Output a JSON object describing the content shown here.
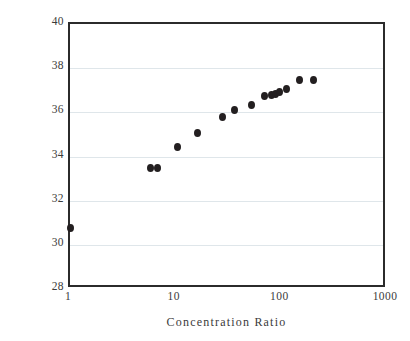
{
  "chart_data": {
    "type": "scatter",
    "title": "",
    "xlabel": "Concentration Ratio",
    "ylabel": "Coneversion Efficiency (%)",
    "xscale": "log",
    "yscale": "linear",
    "xlim": [
      1,
      1000
    ],
    "ylim": [
      28,
      40
    ],
    "xticks": [
      1,
      10,
      100,
      1000
    ],
    "xtick_labels": [
      "1",
      "10",
      "100",
      "1000"
    ],
    "yticks": [
      28,
      30,
      32,
      34,
      36,
      38,
      40
    ],
    "ytick_labels": [
      "28",
      "30",
      "32",
      "34",
      "36",
      "38",
      "40"
    ],
    "grid": "horizontal",
    "legend": "none",
    "marker_color": "#231f20",
    "marker_shape": "circle",
    "series": [
      {
        "name": "Conversion efficiency vs concentration ratio",
        "points": [
          {
            "x": 1.0,
            "y": 30.75
          },
          {
            "x": 5.8,
            "y": 33.5
          },
          {
            "x": 6.7,
            "y": 33.5
          },
          {
            "x": 10.3,
            "y": 34.45
          },
          {
            "x": 16.0,
            "y": 35.05
          },
          {
            "x": 28.0,
            "y": 35.8
          },
          {
            "x": 36.0,
            "y": 36.1
          },
          {
            "x": 52.0,
            "y": 36.35
          },
          {
            "x": 70.0,
            "y": 36.75
          },
          {
            "x": 80.0,
            "y": 36.8
          },
          {
            "x": 88.0,
            "y": 36.85
          },
          {
            "x": 97.0,
            "y": 36.9
          },
          {
            "x": 112.0,
            "y": 37.05
          },
          {
            "x": 150.0,
            "y": 37.45
          },
          {
            "x": 200.0,
            "y": 37.45
          }
        ]
      }
    ]
  },
  "axis_colors": {
    "frame": "#2b2b2b",
    "gridline": "#dfe6ea",
    "text": "#3b3b3b"
  }
}
